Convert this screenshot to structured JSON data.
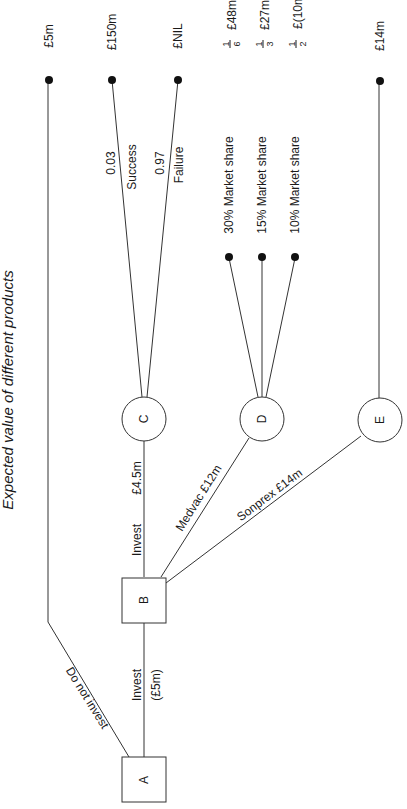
{
  "title": "Expected value of different products",
  "nodes": {
    "A": {
      "label": "A",
      "type": "decision"
    },
    "B": {
      "label": "B",
      "type": "decision"
    },
    "C": {
      "label": "C",
      "type": "chance"
    },
    "D": {
      "label": "D",
      "type": "chance"
    },
    "E": {
      "label": "E",
      "type": "chance"
    }
  },
  "branches": {
    "a_invest": {
      "label": "Invest",
      "cost": "(£5m)"
    },
    "a_do_not_invest": {
      "label": "Do not invest"
    },
    "b_invest": {
      "label": "Invest",
      "value": "£4.5m"
    },
    "b_medvac": {
      "label": "Medvac £12m"
    },
    "b_sonprex": {
      "label": "Sonprex £14m"
    },
    "c_success": {
      "label": "Success",
      "probability": "0.03"
    },
    "c_failure": {
      "label": "Failure",
      "probability": "0.97"
    },
    "d_30": {
      "label": "30% Market share"
    },
    "d_15": {
      "label": "15% Market share"
    },
    "d_10": {
      "label": "10% Market share"
    }
  },
  "outcomes": {
    "do_not_invest": "£5m",
    "success": "£150m",
    "failure": "£NIL",
    "d_30": {
      "num": "1",
      "den": "6",
      "value": "£48m"
    },
    "d_15": {
      "num": "1",
      "den": "3",
      "value": "£27m"
    },
    "d_10": {
      "num": "1",
      "den": "2",
      "value": "£(10m"
    },
    "e": "£14m"
  }
}
